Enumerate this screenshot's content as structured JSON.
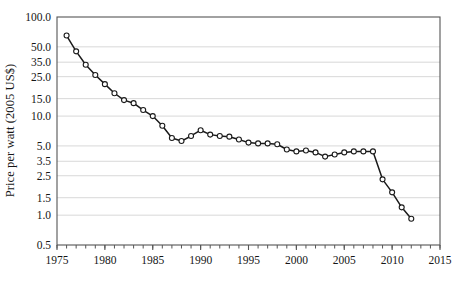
{
  "chart_data": {
    "type": "line",
    "title": "",
    "subtitle": "",
    "xlabel": "",
    "ylabel": "Price per watt (2005 US$)",
    "yscale": "log",
    "xscale": "linear",
    "xlim": [
      1975,
      2015
    ],
    "ylim": [
      0.5,
      100.0
    ],
    "grid": "horizontal",
    "legend": "none",
    "marker": "open-circle",
    "line_color": "#1a1a1a",
    "marker_face_color": "#ffffff",
    "grid_color": "#d8d8d8",
    "axis_color": "#555555",
    "ytick_labels": [
      "100.0",
      "50.0",
      "35.0",
      "25.0",
      "15.0",
      "10.0",
      "5.0",
      "3.5",
      "2.5",
      "1.5",
      "1.0",
      "0.5"
    ],
    "ytick_values": [
      100.0,
      50.0,
      35.0,
      25.0,
      15.0,
      10.0,
      5.0,
      3.5,
      2.5,
      1.5,
      1.0,
      0.5
    ],
    "xtick_labels": [
      "1975",
      "1980",
      "1985",
      "1990",
      "1995",
      "2000",
      "2005",
      "2010",
      "2015"
    ],
    "xtick_values": [
      1975,
      1980,
      1985,
      1990,
      1995,
      2000,
      2005,
      2010,
      2015
    ],
    "x_minor_tick_step": 1,
    "series": [
      {
        "name": "Solar PV module price per watt",
        "x": [
          1976,
          1977,
          1978,
          1979,
          1980,
          1981,
          1982,
          1983,
          1984,
          1985,
          1986,
          1987,
          1988,
          1989,
          1990,
          1991,
          1992,
          1993,
          1994,
          1995,
          1996,
          1997,
          1998,
          1999,
          2000,
          2001,
          2002,
          2003,
          2004,
          2005,
          2006,
          2007,
          2008,
          2009,
          2010,
          2011,
          2012
        ],
        "values": [
          65.0,
          45.0,
          33.0,
          26.0,
          21.0,
          17.0,
          14.5,
          13.5,
          11.5,
          10.0,
          8.0,
          6.0,
          5.6,
          6.3,
          7.2,
          6.5,
          6.3,
          6.2,
          5.8,
          5.4,
          5.3,
          5.3,
          5.2,
          4.6,
          4.4,
          4.5,
          4.3,
          3.9,
          4.1,
          4.3,
          4.4,
          4.4,
          4.4,
          2.3,
          1.7,
          1.2,
          0.92
        ]
      }
    ]
  },
  "axes": {
    "plot_left": 57,
    "plot_right": 440,
    "plot_top": 17,
    "plot_bottom": 245
  }
}
